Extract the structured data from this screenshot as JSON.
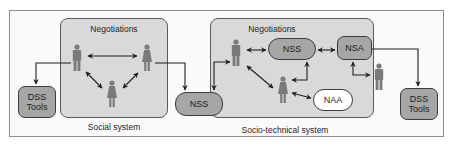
{
  "diagram": {
    "social": {
      "title": "Negotiations",
      "caption": "Social system"
    },
    "sociotechnical": {
      "title": "Negotiations",
      "caption": "Socio-technical system"
    },
    "nodes": {
      "dss_left": "DSS\nTools",
      "nss_left": "NSS",
      "nss_inner": "NSS",
      "nsa": "NSA",
      "naa": "NAA",
      "dss_right": "DSS\nTools"
    },
    "colors": {
      "group_fill": "#d9d9d9",
      "node_fill": "#a6a6a6",
      "person_fill": "#7a7a7a",
      "line": "#1e1e1e"
    }
  }
}
